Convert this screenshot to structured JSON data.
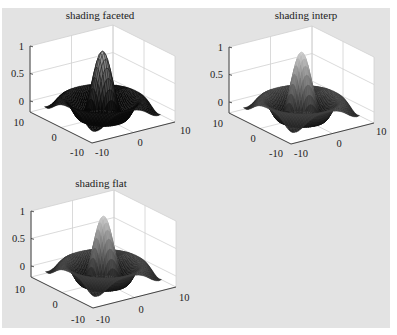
{
  "figure": {
    "background": "#e3e3e3",
    "axes_background": "#ffffff",
    "grid_color": "#d0d0d0",
    "axis_color": "#333333"
  },
  "chart_data": [
    {
      "type": "surface",
      "title": "shading faceted",
      "shading": "faceted",
      "function": "z = sin(r)/r, r = sqrt(x^2 + y^2)",
      "xlim": [
        -10,
        10
      ],
      "ylim": [
        -10,
        10
      ],
      "zlim": [
        -0.2,
        1
      ],
      "xticks": [
        "-10",
        "0",
        "10"
      ],
      "yticks": [
        "-10",
        "0",
        "10"
      ],
      "zticks": [
        "0",
        "0.5",
        "1"
      ],
      "grid": true,
      "colormap": "gray"
    },
    {
      "type": "surface",
      "title": "shading interp",
      "shading": "interp",
      "function": "z = sin(r)/r, r = sqrt(x^2 + y^2)",
      "xlim": [
        -10,
        10
      ],
      "ylim": [
        -10,
        10
      ],
      "zlim": [
        -0.2,
        1
      ],
      "xticks": [
        "-10",
        "0",
        "10"
      ],
      "yticks": [
        "-10",
        "0",
        "10"
      ],
      "zticks": [
        "0",
        "0.5",
        "1"
      ],
      "grid": true,
      "colormap": "gray"
    },
    {
      "type": "surface",
      "title": "shading flat",
      "shading": "flat",
      "function": "z = sin(r)/r, r = sqrt(x^2 + y^2)",
      "xlim": [
        -10,
        10
      ],
      "ylim": [
        -10,
        10
      ],
      "zlim": [
        -0.2,
        1
      ],
      "xticks": [
        "-10",
        "0",
        "10"
      ],
      "yticks": [
        "-10",
        "0",
        "10"
      ],
      "zticks": [
        "0",
        "0.5",
        "1"
      ],
      "grid": true,
      "colormap": "gray"
    }
  ],
  "plots": [
    {
      "title": "shading faceted",
      "z_labels": {
        "one": "1",
        "half": "0.5",
        "zero": "0"
      },
      "y_labels": {
        "max": "10",
        "mid": "0",
        "min": "-10"
      },
      "x_labels": {
        "min": "-10",
        "mid": "0",
        "max": "10"
      }
    },
    {
      "title": "shading interp",
      "z_labels": {
        "one": "1",
        "half": "0.5",
        "zero": "0"
      },
      "y_labels": {
        "max": "10",
        "mid": "0",
        "min": "-10"
      },
      "x_labels": {
        "min": "-10",
        "mid": "0",
        "max": "10"
      }
    },
    {
      "title": "shading flat",
      "z_labels": {
        "one": "1",
        "half": "0.5",
        "zero": "0"
      },
      "y_labels": {
        "max": "10",
        "mid": "0",
        "min": "-10"
      },
      "x_labels": {
        "min": "-10",
        "mid": "0",
        "max": "10"
      }
    }
  ]
}
